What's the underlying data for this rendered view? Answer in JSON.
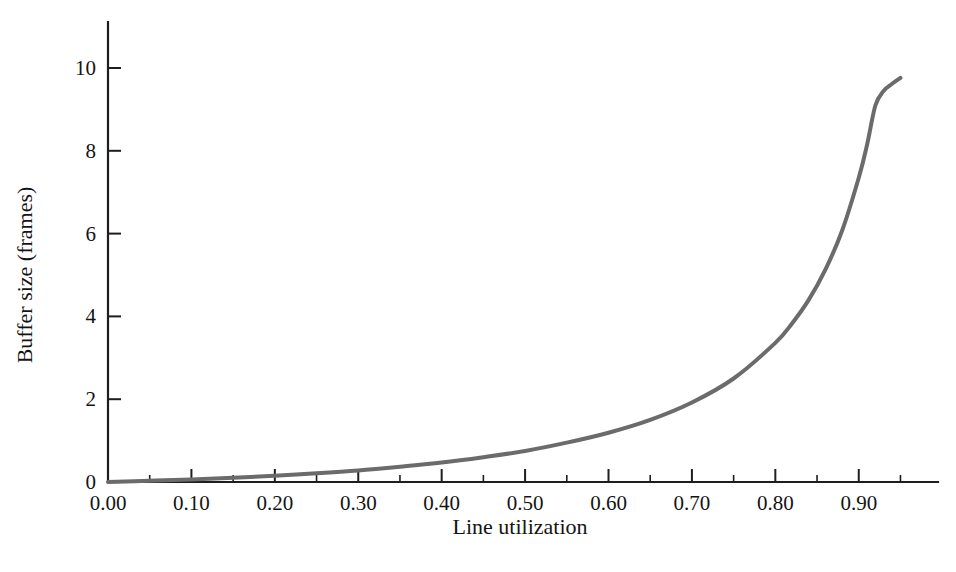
{
  "figure": {
    "background_color": "#ffffff",
    "axis_color": "#1e1e1e",
    "text_color": "#141414"
  },
  "chart_data": {
    "type": "line",
    "title": "",
    "subtitle": "",
    "xlabel": "Line utilization",
    "ylabel": "Buffer size (frames)",
    "xlim": [
      0.0,
      0.995
    ],
    "ylim": [
      0.0,
      11.0
    ],
    "grid": false,
    "legend": null,
    "legend_position": "none",
    "x_major_ticks": [
      0.0,
      0.1,
      0.2,
      0.3,
      0.4,
      0.5,
      0.6,
      0.7,
      0.8,
      0.9
    ],
    "x_major_tick_labels": [
      "0.00",
      "0.10",
      "0.20",
      "0.30",
      "0.40",
      "0.50",
      "0.60",
      "0.70",
      "0.80",
      "0.90"
    ],
    "x_minor_ticks": [
      0.05,
      0.15,
      0.25,
      0.35,
      0.45,
      0.55,
      0.65,
      0.75,
      0.85,
      0.95
    ],
    "y_major_ticks": [
      0,
      2,
      4,
      6,
      8,
      10
    ],
    "y_major_tick_labels": [
      "0",
      "2",
      "4",
      "6",
      "8",
      "10"
    ],
    "series": [
      {
        "name": "Buffer size",
        "color": "#6b6b6b",
        "line_width": 4.0,
        "x": [
          0.0,
          0.05,
          0.1,
          0.15,
          0.2,
          0.25,
          0.3,
          0.35,
          0.4,
          0.45,
          0.5,
          0.55,
          0.6,
          0.65,
          0.7,
          0.75,
          0.8,
          0.82,
          0.84,
          0.86,
          0.88,
          0.9,
          0.91,
          0.92,
          0.93,
          0.94,
          0.95
        ],
        "y": [
          0.0,
          0.03,
          0.06,
          0.1,
          0.15,
          0.21,
          0.28,
          0.37,
          0.47,
          0.6,
          0.75,
          0.95,
          1.19,
          1.5,
          1.92,
          2.5,
          3.36,
          3.83,
          4.4,
          5.13,
          6.07,
          7.35,
          8.15,
          9.1,
          9.45,
          9.62,
          9.76
        ]
      }
    ]
  }
}
